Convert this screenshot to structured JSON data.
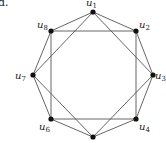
{
  "figure": {
    "label": "d.",
    "edge_color": "#555555",
    "node_color": "#111111"
  },
  "nodes": [
    {
      "id": "u1",
      "name": "u",
      "sub": "1",
      "x": 93,
      "y": 12,
      "lx": 86,
      "ly": 6
    },
    {
      "id": "u2",
      "name": "u",
      "sub": "2",
      "x": 136,
      "y": 31,
      "lx": 139,
      "ly": 28
    },
    {
      "id": "u3",
      "name": "u",
      "sub": "3",
      "x": 153,
      "y": 75,
      "lx": 155,
      "ly": 79
    },
    {
      "id": "u4",
      "name": "u",
      "sub": "4",
      "x": 136,
      "y": 119,
      "lx": 139,
      "ly": 130
    },
    {
      "id": "u5",
      "name": "",
      "sub": "",
      "x": 93,
      "y": 137,
      "lx": 0,
      "ly": 0
    },
    {
      "id": "u6",
      "name": "u",
      "sub": "6",
      "x": 51,
      "y": 119,
      "lx": 39,
      "ly": 130
    },
    {
      "id": "u7",
      "name": "u",
      "sub": "7",
      "x": 33,
      "y": 75,
      "lx": 15,
      "ly": 79
    },
    {
      "id": "u8",
      "name": "u",
      "sub": "8",
      "x": 51,
      "y": 31,
      "lx": 37,
      "ly": 28
    }
  ],
  "edges": [
    [
      "u1",
      "u2"
    ],
    [
      "u2",
      "u3"
    ],
    [
      "u3",
      "u4"
    ],
    [
      "u4",
      "u5"
    ],
    [
      "u5",
      "u6"
    ],
    [
      "u6",
      "u7"
    ],
    [
      "u7",
      "u8"
    ],
    [
      "u8",
      "u1"
    ],
    [
      "u2",
      "u4"
    ],
    [
      "u4",
      "u6"
    ],
    [
      "u6",
      "u8"
    ],
    [
      "u8",
      "u2"
    ],
    [
      "u1",
      "u3"
    ],
    [
      "u3",
      "u5"
    ],
    [
      "u5",
      "u7"
    ],
    [
      "u7",
      "u1"
    ]
  ]
}
